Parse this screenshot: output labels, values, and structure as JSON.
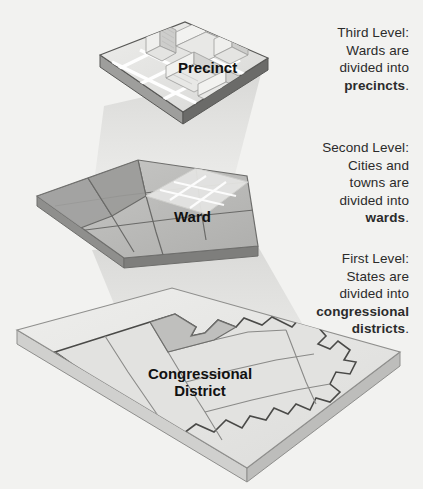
{
  "figure": {
    "kind": "hierarchy-diagram",
    "background_color": "#f2f2f0",
    "page_color": "#ffffff"
  },
  "annotations": [
    {
      "id": "third",
      "heading": "Third Level:",
      "line1": "Wards are",
      "line2": "divided into",
      "emphasis": "precincts",
      "trailing": "."
    },
    {
      "id": "second",
      "heading": "Second Level:",
      "line1": "Cities and",
      "line2": "towns are",
      "line3": "divided into",
      "emphasis": "wards",
      "trailing": "."
    },
    {
      "id": "first",
      "heading": "First Level:",
      "line1": "States are",
      "line2": "divided into",
      "emphasis": "congressional",
      "emphasis2": "districts",
      "trailing": "."
    }
  ],
  "layers": [
    {
      "id": "precinct",
      "label": "Precinct",
      "order": 3,
      "description": "city block with buildings"
    },
    {
      "id": "ward",
      "label": "Ward",
      "order": 2,
      "description": "irregular ward polygons"
    },
    {
      "id": "congressional-district",
      "label_line1": "Congressional",
      "label_line2": "District",
      "order": 1,
      "description": "state outline with district boundaries"
    }
  ],
  "colors": {
    "slab_top_light": "#e8e8e6",
    "slab_top_mid": "#d2d2d0",
    "slab_top_dark": "#b9b9b7",
    "slab_edge": "#8f8f8d",
    "slab_edge_dark": "#6e6e6c",
    "outline": "#5a5a58",
    "building_light": "#f4f4f2",
    "building_shade": "#cfcfcd",
    "beam": "#d9d9d7",
    "text": "#2b2b2b",
    "label": "#111111"
  }
}
